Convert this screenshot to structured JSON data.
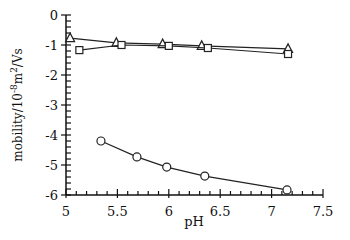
{
  "chart_data": {
    "type": "line",
    "title": "",
    "xlabel": "pH",
    "ylabel": "mobility/10^-8 m^2/Vs",
    "ylabel_parts": {
      "base": "mobility/10",
      "exp1": "-8",
      "mid": "m",
      "exp2": "2",
      "tail": "/Vs"
    },
    "xlim": [
      5,
      7.5
    ],
    "ylim": [
      -6,
      0
    ],
    "x_ticks": [
      "5",
      "5.5",
      "6",
      "6.5",
      "7",
      "7.5"
    ],
    "x_tick_values": [
      5,
      5.5,
      6,
      6.5,
      7,
      7.5
    ],
    "y_ticks": [
      "0",
      "-1",
      "-2",
      "-3",
      "-4",
      "-5",
      "-6"
    ],
    "y_tick_values": [
      0,
      -1,
      -2,
      -3,
      -4,
      -5,
      -6
    ],
    "grid": false,
    "legend": null,
    "series": [
      {
        "name": "triangles",
        "marker": "triangle",
        "x": [
          5.04,
          5.49,
          5.94,
          6.32,
          7.16
        ],
        "y": [
          -0.77,
          -0.93,
          -0.97,
          -1.03,
          -1.13
        ]
      },
      {
        "name": "squares",
        "marker": "square",
        "x": [
          5.13,
          5.54,
          6.0,
          6.38,
          7.16
        ],
        "y": [
          -1.17,
          -1.0,
          -1.03,
          -1.1,
          -1.3
        ]
      },
      {
        "name": "circles",
        "marker": "circle",
        "x": [
          5.34,
          5.69,
          5.98,
          6.35,
          7.15
        ],
        "y": [
          -4.2,
          -4.73,
          -5.07,
          -5.37,
          -5.83
        ]
      }
    ]
  }
}
